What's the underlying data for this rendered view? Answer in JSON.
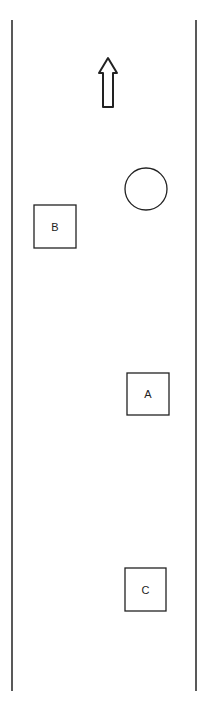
{
  "diagram": {
    "type": "road-layout",
    "stroke_color": "#222222",
    "background": "#ffffff",
    "road": {
      "left_edge": {
        "x": 12,
        "y1": 20,
        "y2": 691
      },
      "right_edge": {
        "x": 196,
        "y1": 20,
        "y2": 691
      }
    },
    "direction_arrow": {
      "icon": "arrow-up-icon",
      "x": 98,
      "y": 57,
      "width": 20,
      "height": 51
    },
    "circle": {
      "cx": 146,
      "cy": 189,
      "r": 21
    },
    "boxes": [
      {
        "label": "B",
        "x": 34,
        "y": 205,
        "width": 42,
        "height": 43
      },
      {
        "label": "A",
        "x": 127,
        "y": 373,
        "width": 42,
        "height": 42
      },
      {
        "label": "C",
        "x": 125,
        "y": 568,
        "width": 41,
        "height": 43
      }
    ]
  }
}
